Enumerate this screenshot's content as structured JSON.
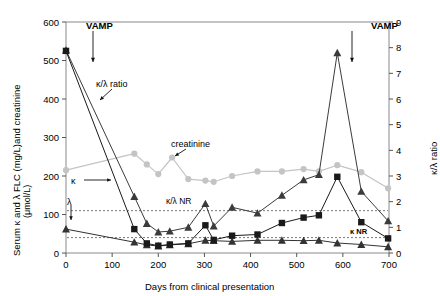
{
  "chart_data": {
    "type": "line",
    "title": "",
    "xlabel": "Days from clinical presentation",
    "ylabel_left": "Serum κ and λ FLC (mg/L)and creatinine (μmol/L)",
    "ylabel_right": "κ/λ ratio",
    "xlim": [
      0,
      700
    ],
    "ylim_left": [
      0,
      600
    ],
    "ylim_right": [
      0,
      9
    ],
    "xticks": [
      0,
      100,
      200,
      300,
      400,
      500,
      600,
      700
    ],
    "yticks_left": [
      0,
      100,
      200,
      300,
      400,
      500,
      600
    ],
    "yticks_right": [
      0,
      1,
      2,
      3,
      4,
      5,
      6,
      7,
      8,
      9
    ],
    "grid": false,
    "legend_position": "inline-annotations",
    "series": [
      {
        "name": "κ",
        "marker": "square",
        "color": "#1a1a1a",
        "axis": "left",
        "points": [
          {
            "x": 0,
            "y": 525
          },
          {
            "x": 148,
            "y": 62
          },
          {
            "x": 175,
            "y": 25
          },
          {
            "x": 200,
            "y": 19
          },
          {
            "x": 225,
            "y": 22
          },
          {
            "x": 265,
            "y": 25
          },
          {
            "x": 302,
            "y": 72
          },
          {
            "x": 320,
            "y": 34
          },
          {
            "x": 360,
            "y": 45
          },
          {
            "x": 415,
            "y": 48
          },
          {
            "x": 468,
            "y": 78
          },
          {
            "x": 515,
            "y": 92
          },
          {
            "x": 548,
            "y": 98
          },
          {
            "x": 588,
            "y": 198
          },
          {
            "x": 640,
            "y": 80
          },
          {
            "x": 698,
            "y": 38
          }
        ]
      },
      {
        "name": "λ",
        "marker": "triangle",
        "color": "#333333",
        "axis": "left",
        "points": [
          {
            "x": 0,
            "y": 62
          },
          {
            "x": 148,
            "y": 28
          },
          {
            "x": 175,
            "y": 21
          },
          {
            "x": 200,
            "y": 18
          },
          {
            "x": 225,
            "y": 21
          },
          {
            "x": 265,
            "y": 24
          },
          {
            "x": 302,
            "y": 33
          },
          {
            "x": 320,
            "y": 32
          },
          {
            "x": 360,
            "y": 30
          },
          {
            "x": 415,
            "y": 33
          },
          {
            "x": 468,
            "y": 33
          },
          {
            "x": 515,
            "y": 32
          },
          {
            "x": 548,
            "y": 33
          },
          {
            "x": 588,
            "y": 26
          },
          {
            "x": 640,
            "y": 22
          },
          {
            "x": 698,
            "y": 16
          }
        ]
      },
      {
        "name": "κ/λ ratio",
        "marker": "triangle",
        "color": "#3b3b3b",
        "axis": "right",
        "points": [
          {
            "x": 0,
            "y": 7.9
          },
          {
            "x": 148,
            "y": 2.2
          },
          {
            "x": 175,
            "y": 1.15
          },
          {
            "x": 200,
            "y": 0.82
          },
          {
            "x": 225,
            "y": 0.85
          },
          {
            "x": 265,
            "y": 1.0
          },
          {
            "x": 302,
            "y": 1.92
          },
          {
            "x": 320,
            "y": 1.05
          },
          {
            "x": 360,
            "y": 1.78
          },
          {
            "x": 415,
            "y": 1.55
          },
          {
            "x": 468,
            "y": 2.25
          },
          {
            "x": 515,
            "y": 2.85
          },
          {
            "x": 548,
            "y": 3.05
          },
          {
            "x": 588,
            "y": 7.8
          },
          {
            "x": 640,
            "y": 2.4
          },
          {
            "x": 698,
            "y": 1.25
          }
        ]
      },
      {
        "name": "creatinine",
        "marker": "circle",
        "color": "#c4c4c4",
        "axis": "left",
        "points": [
          {
            "x": 0,
            "y": 215
          },
          {
            "x": 148,
            "y": 258
          },
          {
            "x": 175,
            "y": 230
          },
          {
            "x": 200,
            "y": 205
          },
          {
            "x": 230,
            "y": 248
          },
          {
            "x": 265,
            "y": 192
          },
          {
            "x": 302,
            "y": 188
          },
          {
            "x": 320,
            "y": 185
          },
          {
            "x": 360,
            "y": 200
          },
          {
            "x": 415,
            "y": 212
          },
          {
            "x": 468,
            "y": 212
          },
          {
            "x": 515,
            "y": 218
          },
          {
            "x": 548,
            "y": 212
          },
          {
            "x": 588,
            "y": 228
          },
          {
            "x": 640,
            "y": 210
          },
          {
            "x": 698,
            "y": 168
          }
        ]
      }
    ],
    "reference_lines": [
      {
        "label": "κ/λ NR",
        "value": 1.65,
        "axis": "right",
        "style": "dashed"
      },
      {
        "label": "κ NR",
        "value": 0.6,
        "axis": "right",
        "style": "dashed"
      }
    ],
    "annotations": [
      {
        "text": "VAMP",
        "kind": "arrow-down",
        "x": 95,
        "y": 570
      },
      {
        "text": "VAMP",
        "kind": "arrow-down",
        "x": 600,
        "y": 8.6
      },
      {
        "text": "κ/λ ratio",
        "kind": "arrow",
        "x": 150,
        "y": 420
      },
      {
        "text": "creatinine",
        "kind": "arrow",
        "x": 300,
        "y": 295
      },
      {
        "text": "κ",
        "kind": "arrow-right",
        "x": 100,
        "y": 180
      },
      {
        "text": "λ",
        "kind": "arrow-down",
        "x": 85,
        "y": 120
      },
      {
        "text": "κ/λ NR",
        "kind": "label",
        "x": 300,
        "y": 128
      },
      {
        "text": "κ NR",
        "kind": "label",
        "x": 555,
        "y": 48
      }
    ]
  },
  "labels": {
    "vamp_left": "VAMP",
    "vamp_right": "VAMP",
    "ratio_callout": "κ/λ ratio",
    "creatinine_callout": "creatinine",
    "kappa_callout": "κ",
    "lambda_callout": "λ",
    "kl_nr": "κ/λ NR",
    "k_nr": "κ NR",
    "xlabel": "Days from clinical presentation",
    "ylabel_left_line1": "Serum κ and λ FLC (mg/L)and creatinine",
    "ylabel_left_line2": "(μmol/L)",
    "ylabel_right": "κ/λ ratio",
    "y_left_ticks": [
      "600",
      "500",
      "400",
      "300",
      "200",
      "100",
      "0"
    ],
    "y_right_ticks": [
      "9",
      "8",
      "7",
      "6",
      "5",
      "4",
      "3",
      "2",
      "1",
      "0"
    ],
    "x_ticks": [
      "0",
      "100",
      "200",
      "300",
      "400",
      "500",
      "600",
      "700"
    ]
  },
  "colors": {
    "kappa": "#1a1a1a",
    "lambda": "#333333",
    "ratio": "#3b3b3b",
    "creatinine": "#c4c4c4",
    "frame": "#8a8a8a",
    "background": "#ffffff"
  }
}
